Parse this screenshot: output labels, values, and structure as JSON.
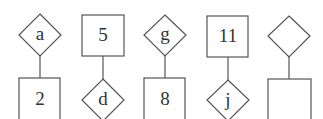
{
  "diagram": {
    "title": "",
    "columns": [
      {
        "top": {
          "shape": "diamond",
          "label": "a"
        },
        "bottom": {
          "shape": "square",
          "label": "2"
        }
      },
      {
        "top": {
          "shape": "square",
          "label": "5"
        },
        "bottom": {
          "shape": "diamond",
          "label": "d"
        }
      },
      {
        "top": {
          "shape": "diamond",
          "label": "g"
        },
        "bottom": {
          "shape": "square",
          "label": "8"
        }
      },
      {
        "top": {
          "shape": "square",
          "label": "11"
        },
        "bottom": {
          "shape": "diamond",
          "label": "j"
        }
      },
      {
        "top": {
          "shape": "diamond",
          "label": ""
        },
        "bottom": {
          "shape": "square",
          "label": ""
        }
      }
    ],
    "colors": {
      "stroke": "#555555",
      "text": "#333333",
      "background": "#ffffff"
    }
  }
}
